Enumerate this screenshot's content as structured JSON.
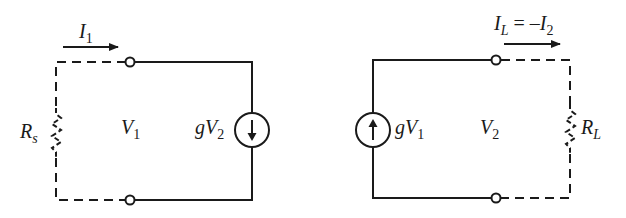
{
  "diagram": {
    "type": "two-port equivalent circuits",
    "stroke_color": "#1a1a1a",
    "input_circuit": {
      "current_label": {
        "main": "I",
        "sub": "1"
      },
      "source_resistor": {
        "main": "R",
        "sub": "s"
      },
      "port_voltage": {
        "main": "V",
        "sub": "1"
      },
      "dependent_source": {
        "prefix": "gV",
        "sub": "2",
        "direction": "down"
      }
    },
    "output_circuit": {
      "current_label": {
        "main": "I",
        "sub": "L",
        "eq": " = –",
        "main2": "I",
        "sub2": "2"
      },
      "load_resistor": {
        "main": "R",
        "sub": "L"
      },
      "port_voltage": {
        "main": "V",
        "sub": "2"
      },
      "dependent_source": {
        "prefix": "gV",
        "sub": "1",
        "direction": "up"
      }
    }
  }
}
